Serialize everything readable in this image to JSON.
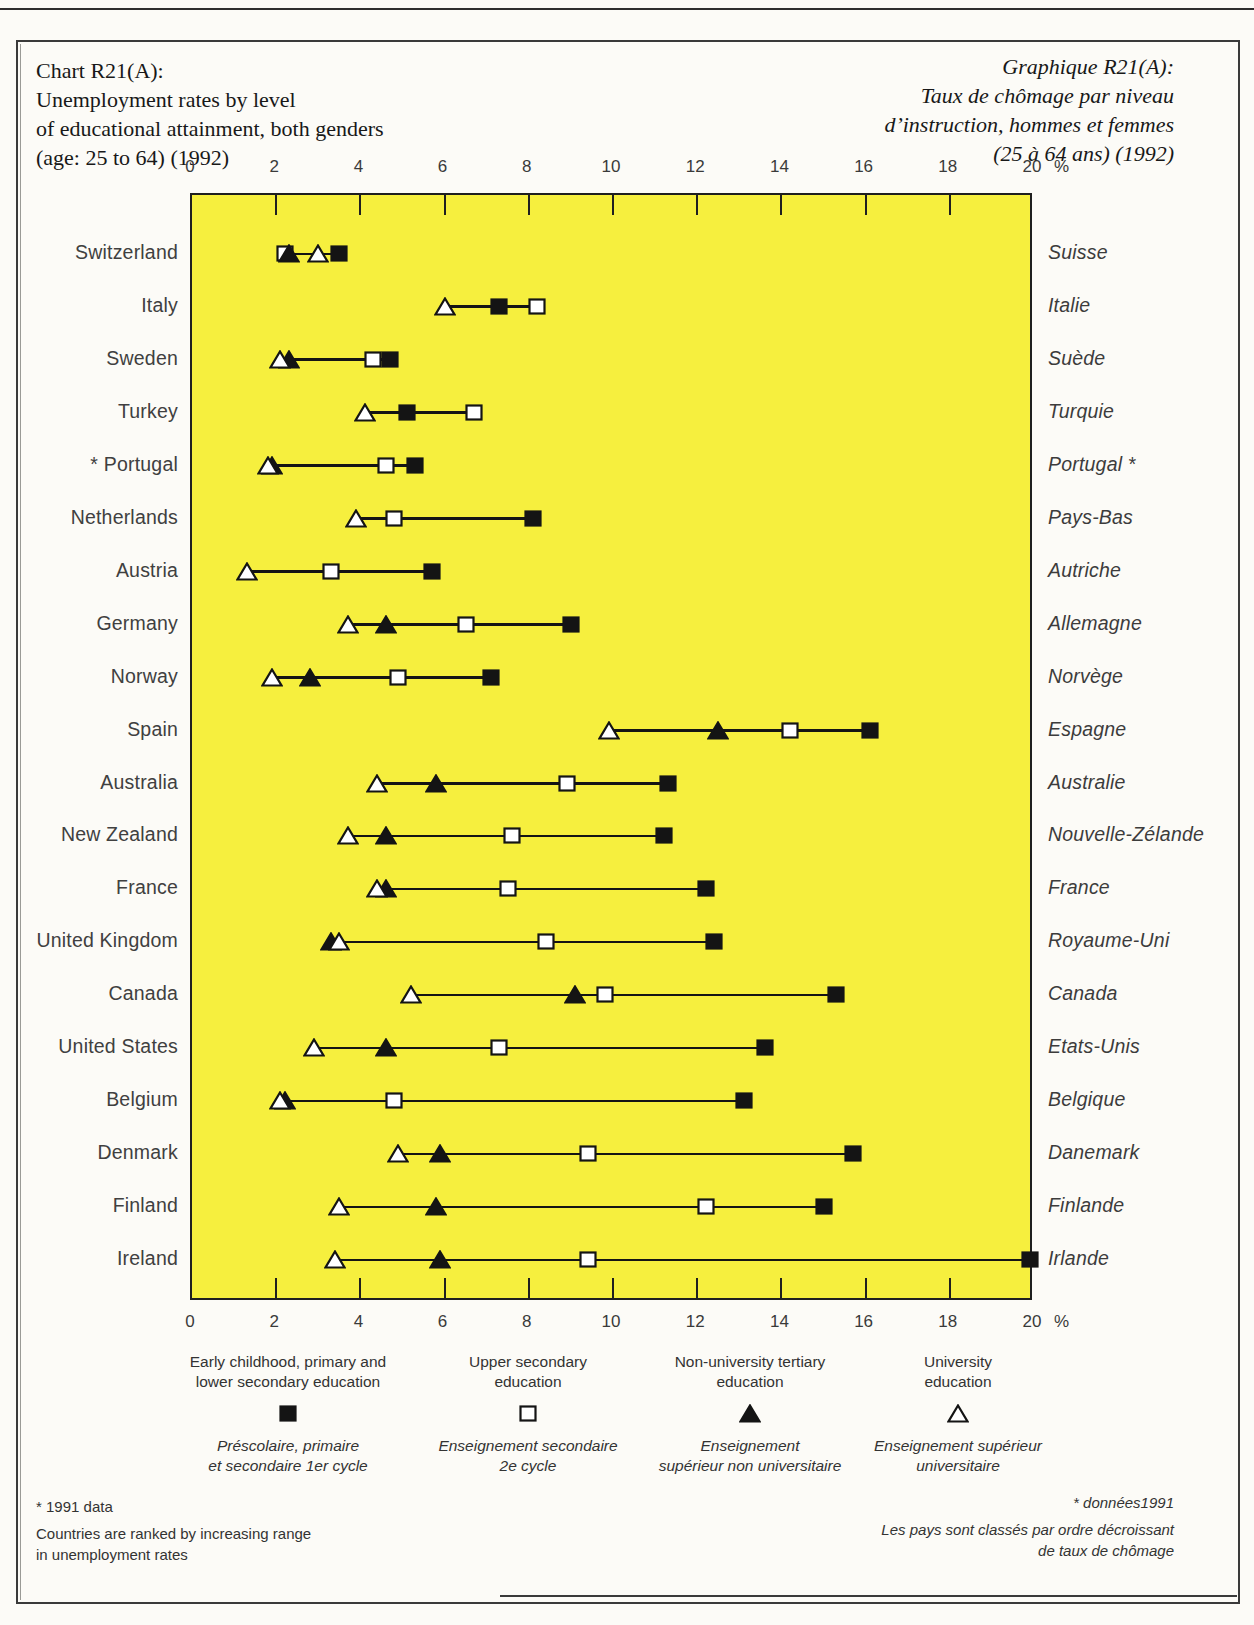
{
  "page": {
    "title_en_lines": [
      "Chart R21(A):",
      "Unemployment rates by level",
      "of educational attainment, both genders",
      "(age: 25 to 64) (1992)"
    ],
    "title_fr_lines": [
      "Graphique R21(A):",
      "Taux de chômage par niveau",
      "d’instruction, hommes et femmes",
      "(25 à 64 ans) (1992)"
    ]
  },
  "chart_data": {
    "type": "scatter",
    "subtype": "dumbbell-range",
    "title": "Unemployment rates by level of educational attainment, both genders (age: 25 to 64) (1992)",
    "xlabel": "Unemployment rate (%)",
    "xlim": [
      0,
      20
    ],
    "axis": {
      "tick_step": 2,
      "tick_labels": [
        "0",
        "2",
        "4",
        "6",
        "8",
        "10",
        "12",
        "14",
        "16",
        "18",
        "20"
      ],
      "unit": "%",
      "grid": false
    },
    "plot_background": "#f6ef3e",
    "countries": [
      {
        "en": "Switzerland",
        "fr": "Suisse"
      },
      {
        "en": "Italy",
        "fr": "Italie"
      },
      {
        "en": "Sweden",
        "fr": "Suède"
      },
      {
        "en": "Turkey",
        "fr": "Turquie"
      },
      {
        "en": "* Portugal",
        "fr": "Portugal *"
      },
      {
        "en": "Netherlands",
        "fr": "Pays-Bas"
      },
      {
        "en": "Austria",
        "fr": "Autriche"
      },
      {
        "en": "Germany",
        "fr": "Allemagne"
      },
      {
        "en": "Norway",
        "fr": "Norvège"
      },
      {
        "en": "Spain",
        "fr": "Espagne"
      },
      {
        "en": "Australia",
        "fr": "Australie"
      },
      {
        "en": "New Zealand",
        "fr": "Nouvelle-Zélande"
      },
      {
        "en": "France",
        "fr": "France"
      },
      {
        "en": "United Kingdom",
        "fr": "Royaume-Uni"
      },
      {
        "en": "Canada",
        "fr": "Canada"
      },
      {
        "en": "United States",
        "fr": "Etats-Unis"
      },
      {
        "en": "Belgium",
        "fr": "Belgique"
      },
      {
        "en": "Denmark",
        "fr": "Danemark"
      },
      {
        "en": "Finland",
        "fr": "Finlande"
      },
      {
        "en": "Ireland",
        "fr": "Irlande"
      }
    ],
    "series": [
      {
        "id": "upper_secondary",
        "name_en": "Upper secondary education",
        "name_fr": "Enseignement secondaire 2e cycle",
        "marker": "open-square",
        "values": [
          2.2,
          8.2,
          4.3,
          6.7,
          4.6,
          4.8,
          3.3,
          6.5,
          4.9,
          14.2,
          8.9,
          7.6,
          7.5,
          8.4,
          9.8,
          7.3,
          4.8,
          9.4,
          12.2,
          9.4
        ]
      },
      {
        "id": "primary",
        "name_en": "Early childhood, primary and lower secondary education",
        "name_fr": "Préscolaire, primaire et secondaire 1er cycle",
        "marker": "filled-square",
        "values": [
          3.5,
          7.3,
          4.7,
          5.1,
          5.3,
          8.1,
          5.7,
          9.0,
          7.1,
          16.1,
          11.3,
          11.2,
          12.2,
          12.4,
          15.3,
          13.6,
          13.1,
          15.7,
          15.0,
          19.9
        ]
      },
      {
        "id": "non_university_tertiary",
        "name_en": "Non-university tertiary education",
        "name_fr": "Enseignement supérieur non universitaire",
        "marker": "filled-triangle",
        "values": [
          2.3,
          null,
          2.3,
          null,
          1.9,
          null,
          null,
          4.6,
          2.8,
          12.5,
          5.8,
          4.6,
          4.6,
          3.3,
          9.1,
          4.6,
          2.2,
          5.9,
          5.8,
          5.9
        ]
      },
      {
        "id": "university",
        "name_en": "University education",
        "name_fr": "Enseignement supérieur universitaire",
        "marker": "open-triangle",
        "values": [
          3.0,
          6.0,
          2.1,
          4.1,
          1.8,
          3.9,
          1.3,
          3.7,
          1.9,
          9.9,
          4.4,
          3.7,
          4.4,
          3.5,
          5.2,
          2.9,
          2.1,
          4.9,
          3.5,
          3.4
        ]
      }
    ],
    "note": "Countries are ranked by increasing range in unemployment rates"
  },
  "legend": {
    "items": [
      {
        "marker": "filled-square",
        "en_lines": [
          "Early childhood, primary and",
          "lower secondary education"
        ],
        "fr_lines": [
          "Préscolaire, primaire",
          "et secondaire 1er cycle"
        ]
      },
      {
        "marker": "open-square",
        "en_lines": [
          "Upper secondary",
          "education"
        ],
        "fr_lines": [
          "Enseignement secondaire",
          "2e cycle"
        ]
      },
      {
        "marker": "filled-triangle",
        "en_lines": [
          "Non-university tertiary",
          "education"
        ],
        "fr_lines": [
          "Enseignement",
          "supérieur non universitaire"
        ]
      },
      {
        "marker": "open-triangle",
        "en_lines": [
          "University",
          "education"
        ],
        "fr_lines": [
          "Enseignement supérieur",
          "universitaire"
        ]
      }
    ]
  },
  "footnotes": {
    "left_lines": [
      "* 1991 data",
      "Countries are ranked by increasing range",
      "in unemployment rates"
    ],
    "right_lines": [
      "* données1991",
      "Les pays sont classés par ordre décroissant",
      "de taux de chômage"
    ]
  },
  "colors": {
    "plot_yellow": "#f6ef3e",
    "ink": "#1f1f1f"
  }
}
